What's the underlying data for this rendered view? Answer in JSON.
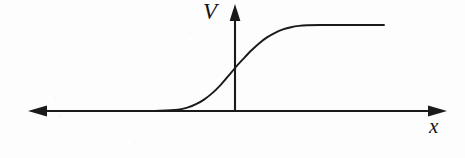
{
  "figure": {
    "kind": "line-plot",
    "caption": "",
    "background_color": "#fdfdfd",
    "ink_color": "#1a1a1a"
  },
  "axes": {
    "x_axis": {
      "label": "x",
      "label_style": "italic-serif",
      "arrow_heads": "both",
      "y_pixel": 111,
      "x_start_pixel": 28,
      "x_end_pixel": 447
    },
    "y_axis": {
      "label": "V",
      "label_style": "italic-serif",
      "arrow_heads": "up",
      "x_pixel": 235,
      "y_top_pixel": 5,
      "y_bottom_pixel": 111
    },
    "origin": {
      "x": 235,
      "y": 111
    },
    "grid": false,
    "tick_labels": [],
    "legend": null
  },
  "chart_data": {
    "type": "line",
    "title": "",
    "subtitle": "",
    "xlabel": "x",
    "ylabel": "V",
    "grid": false,
    "legend": null,
    "xlim": [
      28,
      447
    ],
    "ylim": [
      111,
      25
    ],
    "annotations": [],
    "series": [
      {
        "name": "V(x)",
        "description": "smooth monotonic step (sigmoid) potential rising from 0 to a constant plateau",
        "points_pixel": [
          [
            50,
            111
          ],
          [
            90,
            111
          ],
          [
            130,
            111
          ],
          [
            160,
            110.6
          ],
          [
            178,
            109.6
          ],
          [
            188,
            107.4
          ],
          [
            196,
            104.2
          ],
          [
            204,
            99.6
          ],
          [
            212,
            93.4
          ],
          [
            220,
            85.6
          ],
          [
            228,
            76.4
          ],
          [
            235,
            68.0
          ],
          [
            243,
            59.2
          ],
          [
            251,
            50.8
          ],
          [
            259,
            43.4
          ],
          [
            267,
            37.4
          ],
          [
            275,
            32.8
          ],
          [
            283,
            29.4
          ],
          [
            291,
            27.2
          ],
          [
            299,
            25.9
          ],
          [
            307,
            25.3
          ],
          [
            320,
            25.0
          ],
          [
            345,
            25.0
          ],
          [
            384,
            25.0
          ]
        ],
        "plateau_y_pixel": 25,
        "baseline_y_pixel": 111,
        "inflection_x_pixel": 235,
        "liftoff_x_pixel": 178,
        "end_x_pixel": 384
      }
    ]
  }
}
